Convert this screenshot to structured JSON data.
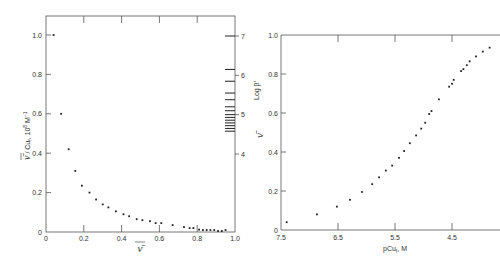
{
  "colors": {
    "axis": "#555555",
    "point": "#222222",
    "text": "#333333",
    "background": "#ffffff"
  },
  "chart_data": [
    {
      "id": "left",
      "type": "scatter",
      "title": "",
      "xlabel": "ν̄",
      "ylabel": "ν̄ / Cu_f, 10^8 M^-1",
      "ylabel_text": {
        "main": "ν̄",
        "sub": " / Cu",
        "subscript": "f",
        "rest": ", 10",
        "sup": "8",
        "unit": " M",
        "unit_sup": "−1"
      },
      "xlim": [
        0,
        1.0
      ],
      "ylim": [
        0,
        1.0
      ],
      "grid": false,
      "x_ticks": [
        0,
        0.2,
        0.4,
        0.6,
        0.8,
        1.0
      ],
      "x_tick_labels": [
        "0",
        "0.2",
        "0.4",
        "0.6",
        "0.8",
        "1.0"
      ],
      "y_ticks": [
        0,
        0.2,
        0.4,
        0.6,
        0.8,
        1.0
      ],
      "y_tick_labels": [
        "0",
        "0.2",
        "0.4",
        "0.6",
        "0.8",
        "1.0"
      ],
      "secondary_y": {
        "label": "Log β'",
        "ticks": [
          4,
          5,
          6,
          7
        ],
        "tick_labels": [
          "4",
          "5",
          "6",
          "7"
        ],
        "hash_marks": [
          7.0,
          6.15,
          5.85,
          5.55,
          5.38,
          5.2,
          5.1,
          5.0,
          4.93,
          4.86,
          4.79,
          4.72,
          4.65,
          4.58
        ]
      },
      "points": [
        [
          0.04,
          1.0
        ],
        [
          0.08,
          0.6
        ],
        [
          0.12,
          0.42
        ],
        [
          0.155,
          0.31
        ],
        [
          0.19,
          0.235
        ],
        [
          0.23,
          0.2
        ],
        [
          0.265,
          0.165
        ],
        [
          0.3,
          0.14
        ],
        [
          0.33,
          0.125
        ],
        [
          0.37,
          0.105
        ],
        [
          0.41,
          0.09
        ],
        [
          0.44,
          0.08
        ],
        [
          0.48,
          0.065
        ],
        [
          0.51,
          0.06
        ],
        [
          0.55,
          0.055
        ],
        [
          0.58,
          0.045
        ],
        [
          0.61,
          0.045
        ],
        [
          0.67,
          0.035
        ],
        [
          0.73,
          0.025
        ],
        [
          0.76,
          0.02
        ],
        [
          0.78,
          0.02
        ],
        [
          0.81,
          0.012
        ],
        [
          0.83,
          0.01
        ],
        [
          0.85,
          0.01
        ],
        [
          0.87,
          0.01
        ],
        [
          0.89,
          0.01
        ],
        [
          0.91,
          0.005
        ],
        [
          0.93,
          0.005
        ],
        [
          0.95,
          0.01
        ]
      ]
    },
    {
      "id": "right",
      "type": "scatter",
      "title": "",
      "xlabel": "pCu_f, M",
      "xlabel_text": {
        "main": "pCu",
        "subscript": "f",
        "rest": ", M"
      },
      "ylabel": "ν̄",
      "xlim": [
        7.5,
        3.65
      ],
      "x_reversed": true,
      "ylim": [
        0,
        1.0
      ],
      "grid": false,
      "x_ticks": [
        7.5,
        6.5,
        5.5,
        4.5
      ],
      "x_tick_labels": [
        "7.5",
        "6.5",
        "5.5",
        "4.5"
      ],
      "y_ticks": [
        0,
        0.2,
        0.4,
        0.6,
        0.8,
        1.0
      ],
      "y_tick_labels": [
        "0",
        "0.2",
        "0.4",
        "0.6",
        "0.8",
        "1.0"
      ],
      "points": [
        [
          7.4,
          0.04
        ],
        [
          6.87,
          0.08
        ],
        [
          6.52,
          0.12
        ],
        [
          6.29,
          0.155
        ],
        [
          6.08,
          0.195
        ],
        [
          5.9,
          0.235
        ],
        [
          5.78,
          0.27
        ],
        [
          5.66,
          0.305
        ],
        [
          5.55,
          0.33
        ],
        [
          5.43,
          0.37
        ],
        [
          5.34,
          0.405
        ],
        [
          5.24,
          0.445
        ],
        [
          5.13,
          0.485
        ],
        [
          5.04,
          0.52
        ],
        [
          4.97,
          0.55
        ],
        [
          4.9,
          0.595
        ],
        [
          4.86,
          0.61
        ],
        [
          4.73,
          0.67
        ],
        [
          4.55,
          0.735
        ],
        [
          4.5,
          0.75
        ],
        [
          4.47,
          0.77
        ],
        [
          4.34,
          0.815
        ],
        [
          4.3,
          0.825
        ],
        [
          4.24,
          0.845
        ],
        [
          4.19,
          0.865
        ],
        [
          4.08,
          0.89
        ],
        [
          3.96,
          0.915
        ],
        [
          3.84,
          0.935
        ]
      ]
    }
  ]
}
